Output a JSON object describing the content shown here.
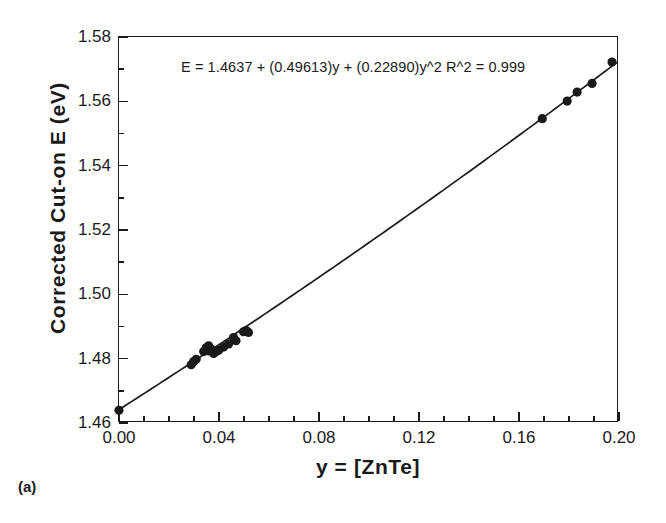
{
  "panel_label": "(a)",
  "chart_data": {
    "type": "scatter",
    "title": "",
    "xlabel": "y = [ZnTe]",
    "ylabel": "Corrected Cut-on E (eV)",
    "xlim": [
      0.0,
      0.2
    ],
    "ylim": [
      1.46,
      1.58
    ],
    "grid": false,
    "legend": null,
    "annotations": [
      "E = 1.4637 + (0.49613)y + (0.22890)y^2   R^2 = 0.999"
    ],
    "fit": {
      "form": "quadratic",
      "intercept": 1.4637,
      "linear_coef": 0.49613,
      "quadratic_coef": 0.2289,
      "r_squared": 0.999,
      "equation_text": "E = 1.4637 + (0.49613)y + (0.22890)y^2",
      "r2_text": "R^2 = 0.999"
    },
    "xticks": [
      0.0,
      0.04,
      0.08,
      0.12,
      0.16,
      0.2
    ],
    "xtick_labels": [
      "0.00",
      "0.04",
      "0.08",
      "0.12",
      "0.16",
      "0.20"
    ],
    "xtick_minor_step": 0.01,
    "yticks": [
      1.46,
      1.48,
      1.5,
      1.52,
      1.54,
      1.56,
      1.58
    ],
    "ytick_labels": [
      "1.46",
      "1.48",
      "1.50",
      "1.52",
      "1.54",
      "1.56",
      "1.58"
    ],
    "ytick_minor_step": 0.01,
    "series": [
      {
        "name": "Corrected cut-on energy",
        "marker": "filled-circle",
        "color": "#1a1a1a",
        "points": [
          {
            "x": 0.0,
            "y": 1.4635
          },
          {
            "x": 0.029,
            "y": 1.4777
          },
          {
            "x": 0.03,
            "y": 1.4787
          },
          {
            "x": 0.031,
            "y": 1.4794
          },
          {
            "x": 0.034,
            "y": 1.4818
          },
          {
            "x": 0.035,
            "y": 1.483
          },
          {
            "x": 0.036,
            "y": 1.4836
          },
          {
            "x": 0.036,
            "y": 1.482
          },
          {
            "x": 0.037,
            "y": 1.4826
          },
          {
            "x": 0.038,
            "y": 1.4812
          },
          {
            "x": 0.039,
            "y": 1.4818
          },
          {
            "x": 0.04,
            "y": 1.4822
          },
          {
            "x": 0.01,
            "y": null
          },
          {
            "x": 0.042,
            "y": 1.4832
          },
          {
            "x": 0.044,
            "y": 1.4842
          },
          {
            "x": 0.046,
            "y": 1.4862
          },
          {
            "x": 0.047,
            "y": 1.4852
          },
          {
            "x": 0.05,
            "y": 1.488
          },
          {
            "x": 0.051,
            "y": 1.4884
          },
          {
            "x": 0.052,
            "y": 1.4878
          },
          {
            "x": 0.17,
            "y": 1.5545
          },
          {
            "x": 0.18,
            "y": 1.56
          },
          {
            "x": 0.184,
            "y": 1.5628
          },
          {
            "x": 0.19,
            "y": 1.5655
          },
          {
            "x": 0.198,
            "y": 1.5722
          }
        ]
      }
    ]
  }
}
